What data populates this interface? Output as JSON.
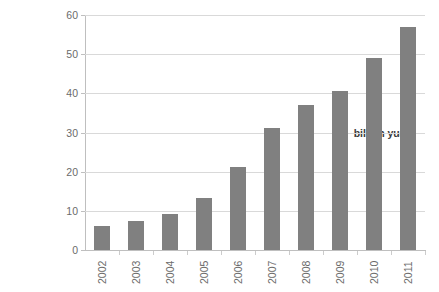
{
  "figure": {
    "background_color": "#ffffff",
    "title_remnant": "",
    "bar_color": "#808080",
    "gridline_color": "#d9d9d9",
    "axis_color": "#bfbfbf",
    "tick_label_color": "#6b6b6b"
  },
  "chart_data": {
    "type": "bar",
    "title": "",
    "subtitle": "",
    "xlabel": "",
    "ylabel": "billion yuan",
    "categories": [
      "2002",
      "2003",
      "2004",
      "2005",
      "2006",
      "2007",
      "2008",
      "2009",
      "2010",
      "2011"
    ],
    "values": [
      6.2,
      7.5,
      9.2,
      13.3,
      21.2,
      31.2,
      37.0,
      40.5,
      49.0,
      57.0
    ],
    "ylim": [
      0,
      60
    ],
    "y_ticks": [
      0,
      10,
      20,
      30,
      40,
      50,
      60
    ],
    "y_tick_labels": [
      "0",
      "10",
      "20",
      "30",
      "40",
      "50",
      "60"
    ],
    "x_tick_labels": [
      "2002",
      "2003",
      "2004",
      "2005",
      "2006",
      "2007",
      "2008",
      "2009",
      "2010",
      "2011"
    ],
    "x_tick_label_rotation": 90,
    "grid": true,
    "grid_axis": "y",
    "legend": false,
    "legend_position": "none",
    "series": [
      {
        "name": "billion yuan",
        "color": "#808080",
        "values": [
          6.2,
          7.5,
          9.2,
          13.3,
          21.2,
          31.2,
          37.0,
          40.5,
          49.0,
          57.0
        ]
      }
    ],
    "annotations": []
  }
}
